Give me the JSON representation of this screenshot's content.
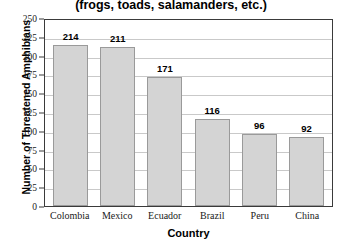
{
  "chart_data": {
    "type": "bar",
    "title": "Threatened Amphibian Species",
    "title_line1": "Threatened Amphibian Species",
    "title_line2": "(frogs, toads, salamanders, etc.)",
    "subtitle": "(frogs, toads, salamanders, etc.)",
    "categories": [
      "Colombia",
      "Mexico",
      "Ecuador",
      "Brazil",
      "Peru",
      "China"
    ],
    "values": [
      214,
      211,
      171,
      116,
      96,
      92
    ],
    "xlabel": "Country",
    "ylabel": "Number of Threatened Amphibians",
    "ylim": [
      0,
      250
    ],
    "ytick_step": 25,
    "yticks": [
      250,
      225,
      200,
      175,
      150,
      125,
      100,
      75,
      50,
      25,
      0
    ],
    "grid": true,
    "grid_axis": "y",
    "legend": false,
    "legend_position": "none",
    "bar_color": "#d4d4d4",
    "bar_border_color": "#9a9a9a",
    "gridline_color": "#c9c9c9",
    "axis_color": "#3a3a3a",
    "text_color": "#000000"
  }
}
